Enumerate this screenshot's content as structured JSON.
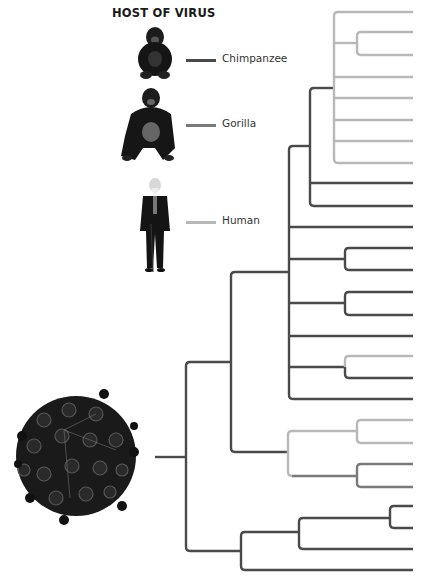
{
  "legend": {
    "title": "HOST OF VIRUS",
    "items": [
      {
        "label": "Chimpanzee",
        "color": "#4a4a4a",
        "icon": "chimpanzee-icon"
      },
      {
        "label": "Gorilla",
        "color": "#7a7a7a",
        "icon": "gorilla-icon"
      },
      {
        "label": "Human",
        "color": "#b8b8b8",
        "icon": "human-icon"
      }
    ]
  },
  "root_image": "virus-particle-icon",
  "colors": {
    "chimpanzee": "#4a4a4a",
    "gorilla": "#7a7a7a",
    "human": "#b8b8b8"
  },
  "tree": {
    "leaf_count": 27,
    "leaves": [
      {
        "y": 12,
        "host": "human"
      },
      {
        "y": 32,
        "host": "human"
      },
      {
        "y": 55,
        "host": "human"
      },
      {
        "y": 77,
        "host": "human"
      },
      {
        "y": 98,
        "host": "human"
      },
      {
        "y": 120,
        "host": "human"
      },
      {
        "y": 141,
        "host": "human"
      },
      {
        "y": 163,
        "host": "human"
      },
      {
        "y": 183,
        "host": "chimpanzee"
      },
      {
        "y": 206,
        "host": "chimpanzee"
      },
      {
        "y": 227,
        "host": "chimpanzee"
      },
      {
        "y": 248,
        "host": "chimpanzee"
      },
      {
        "y": 270,
        "host": "chimpanzee"
      },
      {
        "y": 292,
        "host": "chimpanzee"
      },
      {
        "y": 315,
        "host": "chimpanzee"
      },
      {
        "y": 336,
        "host": "chimpanzee"
      },
      {
        "y": 356,
        "host": "human"
      },
      {
        "y": 378,
        "host": "chimpanzee"
      },
      {
        "y": 399,
        "host": "chimpanzee"
      },
      {
        "y": 420,
        "host": "human"
      },
      {
        "y": 443,
        "host": "human"
      },
      {
        "y": 464,
        "host": "gorilla"
      },
      {
        "y": 487,
        "host": "gorilla"
      },
      {
        "y": 506,
        "host": "chimpanzee"
      },
      {
        "y": 528,
        "host": "chimpanzee"
      },
      {
        "y": 549,
        "host": "chimpanzee"
      },
      {
        "y": 570,
        "host": "chimpanzee"
      }
    ]
  }
}
